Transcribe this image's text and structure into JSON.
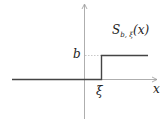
{
  "diagram": {
    "type": "step-function-plot",
    "function_label": {
      "name": "S",
      "subscript": "b, ξ",
      "arg": "(x)"
    },
    "axis_labels": {
      "x": "x"
    },
    "level_label": "b",
    "step_label": "ξ",
    "colors": {
      "function_line": "#444444",
      "axis": "#888888",
      "dotted": "#bbbbbb"
    }
  }
}
